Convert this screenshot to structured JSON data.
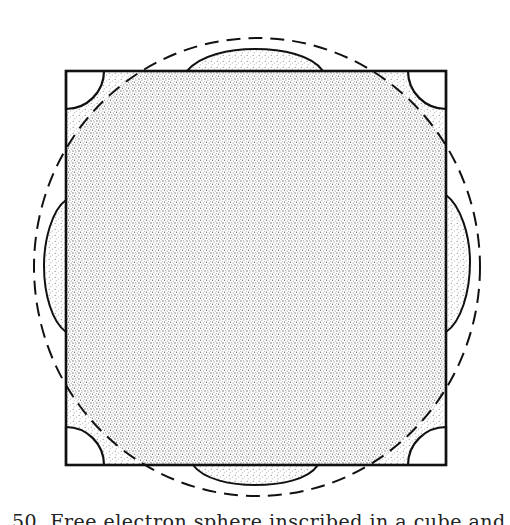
{
  "figure": {
    "square": {
      "x": 66,
      "y": 71,
      "width": 380,
      "height": 394
    },
    "dashed_circle": {
      "cx": 257,
      "cy": 267,
      "rx": 223,
      "ry": 229
    },
    "corner_arc_radius": 38,
    "bulges": {
      "top": {
        "x1": 187,
        "x2": 323,
        "extent_y": 49
      },
      "bottom": {
        "x1": 193,
        "x2": 318,
        "extent_y": 485
      },
      "left": {
        "y1": 200,
        "y2": 332,
        "extent_x": 44
      },
      "right": {
        "y1": 195,
        "y2": 332,
        "extent_x": 470
      }
    },
    "colors": {
      "line": "#111111",
      "stipple_dense": "#6a6a6a",
      "stipple_light": "#9a9a9a",
      "background": "#ffffff"
    }
  },
  "caption": {
    "text": "50.  Free electron sphere inscribed in a cube and the"
  }
}
